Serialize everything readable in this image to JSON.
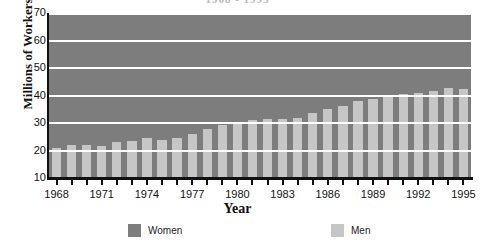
{
  "title": {
    "text": "1968 - 1995",
    "cropped": true
  },
  "axes": {
    "y_title": "Millions of Workers",
    "x_title": "Year",
    "y_ticks": [
      10,
      20,
      30,
      40,
      50,
      60,
      70
    ],
    "y_min": 10,
    "y_max": 70,
    "x_tick_labels": [
      "1968",
      "1971",
      "1974",
      "1977",
      "1980",
      "1983",
      "1986",
      "1989",
      "1992",
      "1995"
    ]
  },
  "legend": {
    "items": [
      {
        "label": "Women",
        "color": "#7d7d7d",
        "swatch_name": "legend-swatch-women"
      },
      {
        "label": "Men",
        "color": "#c6c6c6",
        "swatch_name": "legend-swatch-men"
      }
    ]
  },
  "colors": {
    "women": "#7d7d7d",
    "men": "#c6c6c6",
    "plot_background": "#7d7d7d",
    "gridline": "#ffffff",
    "axis": "#111111",
    "page_background": "#ffffff"
  },
  "chart_data": {
    "type": "bar",
    "stacked": true,
    "title": "1968 - 1995",
    "xlabel": "Year",
    "ylabel": "Millions of Workers",
    "ylim": [
      10,
      70
    ],
    "grid": true,
    "gridlines_y": [
      20,
      30,
      40,
      50,
      60,
      70
    ],
    "legend_position": "bottom",
    "categories": [
      "1968",
      "1969",
      "1970",
      "1971",
      "1972",
      "1973",
      "1974",
      "1975",
      "1976",
      "1977",
      "1978",
      "1979",
      "1980",
      "1981",
      "1982",
      "1983",
      "1984",
      "1985",
      "1986",
      "1987",
      "1988",
      "1989",
      "1990",
      "1991",
      "1992",
      "1993",
      "1994",
      "1995"
    ],
    "series": [
      {
        "name": "Men",
        "color": "#c6c6c6",
        "values": [
          21.0,
          22.0,
          22.0,
          21.8,
          23.2,
          23.6,
          24.4,
          24.0,
          24.6,
          26.0,
          27.8,
          29.2,
          30.2,
          31.0,
          31.4,
          31.6,
          32.0,
          33.6,
          35.0,
          36.2,
          38.0,
          38.8,
          39.8,
          40.4,
          41.0,
          41.6,
          42.8,
          42.2
        ]
      },
      {
        "name": "Women",
        "color": "#7d7d7d",
        "values": [
          23.6,
          23.0,
          23.0,
          23.4,
          23.2,
          24.4,
          24.0,
          23.2,
          23.6,
          24.0,
          23.4,
          23.2,
          21.8,
          21.0,
          19.2,
          19.0,
          21.2,
          20.6,
          20.0,
          20.4,
          19.8,
          19.4,
          17.2,
          16.2,
          16.2,
          17.2,
          16.4,
          17.8
        ]
      }
    ],
    "totals": [
      44.6,
      45.0,
      45.0,
      45.2,
      46.4,
      48.0,
      48.4,
      47.2,
      48.2,
      50.0,
      51.2,
      52.4,
      52.0,
      52.0,
      50.6,
      50.6,
      53.2,
      54.2,
      55.0,
      56.6,
      57.8,
      58.2,
      57.0,
      56.6,
      57.2,
      58.8,
      59.2,
      60.0
    ]
  }
}
